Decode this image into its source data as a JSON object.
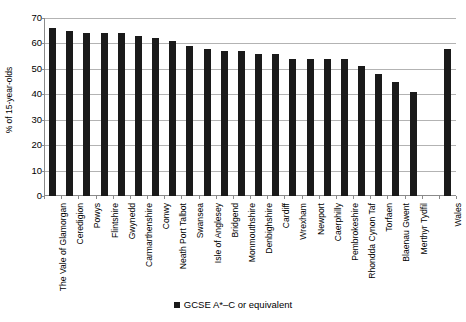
{
  "chart_data": {
    "type": "bar",
    "title": "",
    "subtitle": "",
    "xlabel": "",
    "ylabel": "% of 15-year-olds",
    "ylim": [
      0,
      70
    ],
    "ytick_step": 10,
    "yticks": [
      70,
      60,
      50,
      40,
      30,
      20,
      10,
      0
    ],
    "grid": "horizontal",
    "legend_position": "bottom",
    "series_color": "#1a1a1a",
    "categories": [
      "The Vale of Glamorgan",
      "Ceredigion",
      "Powys",
      "Flintshire",
      "Gwynedd",
      "Carmarthenshire",
      "Conwy",
      "Neath Port Talbot",
      "Swansea",
      "Isle of Anglesey",
      "Bridgend",
      "Monmouthshire",
      "Denbighshire",
      "Cardiff",
      "Wrexham",
      "Newport",
      "Caerphilly",
      "Pembrokeshire",
      "Rhondda Cynon Taf",
      "Torfaen",
      "Blaenau Gwent",
      "Merthyr Tydfil",
      "",
      "Wales"
    ],
    "values": [
      66,
      65,
      64,
      64,
      64,
      63,
      62,
      61,
      59,
      58,
      57,
      57,
      56,
      56,
      54,
      54,
      54,
      54,
      51,
      48,
      45,
      41,
      null,
      58
    ],
    "series": [
      {
        "name": "GCSE A*–C or equivalent",
        "values": [
          66,
          65,
          64,
          64,
          64,
          63,
          62,
          61,
          59,
          58,
          57,
          57,
          56,
          56,
          54,
          54,
          54,
          54,
          51,
          48,
          45,
          41,
          null,
          58
        ]
      }
    ],
    "legend": [
      "GCSE A*–C or equivalent"
    ]
  },
  "legend": {
    "entry_label": "GCSE A*–C or equivalent"
  }
}
